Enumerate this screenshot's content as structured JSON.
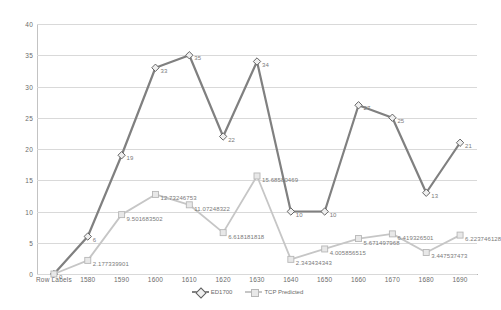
{
  "chart_data": {
    "type": "line",
    "title": "",
    "xlabel": "",
    "ylabel": "",
    "ylim": [
      0,
      40
    ],
    "ytick_step": 5,
    "yticks": [
      "0",
      "5",
      "10",
      "15",
      "20",
      "25",
      "30",
      "35",
      "40"
    ],
    "grid": true,
    "legend_position": "bottom-center",
    "categories": [
      "Row Labels",
      "1580",
      "1590",
      "1600",
      "1610",
      "1620",
      "1630",
      "1640",
      "1650",
      "1660",
      "1670",
      "1680",
      "1690"
    ],
    "series": [
      {
        "name": "ED1700",
        "color": "#808080",
        "marker": "diamond",
        "values": [
          0,
          6,
          19,
          33,
          35,
          22,
          34,
          10,
          10,
          27,
          25,
          13,
          21
        ],
        "labels": [
          "0",
          "6",
          "19",
          "33",
          "35",
          "22",
          "34",
          "10",
          "10",
          "27",
          "25",
          "13",
          "21"
        ]
      },
      {
        "name": "TCP Predicted",
        "color": "#c6c6c6",
        "marker": "square",
        "values": [
          0,
          2.177339901,
          9.501683502,
          12.73246753,
          11.07248322,
          6.618181818,
          15.68580469,
          2.343434343,
          4.005856515,
          5.671497968,
          6.419326501,
          3.447537473,
          6.223746128
        ],
        "labels": [
          "",
          "2.177339901",
          "9.501683502",
          "12.73246753",
          "11.07248322",
          "6.618181818",
          "15.68580469",
          "2.343434343",
          "4.005856515",
          "5.671497968",
          "6.419326501",
          "3.447537473",
          "6.223746128"
        ]
      }
    ]
  },
  "legend": {
    "entries": [
      {
        "label": "ED1700"
      },
      {
        "label": "TCP Predicted"
      }
    ]
  },
  "colors": {
    "series_ed1700": "#808080",
    "series_tcp": "#c6c6c6",
    "gridline": "#d9d9d9",
    "axis_text": "#6b6b6b",
    "background": "#ffffff"
  }
}
